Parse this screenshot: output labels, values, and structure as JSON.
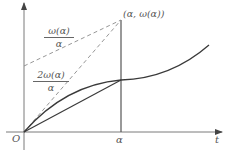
{
  "diagram": {
    "axes": {
      "origin_label": "O",
      "x_label": "t",
      "x_tick_label": "α"
    },
    "point_label": "(α, ω(α))",
    "slope_labels": {
      "upper": {
        "numerator": "ω(α)",
        "denominator": "α"
      },
      "lower": {
        "numerator": "2ω(α)",
        "denominator": "α"
      }
    },
    "colors": {
      "axis": "#7a7a7a",
      "curve": "#3a3a3a",
      "dashed": "#8a8a8a",
      "text": "#555555"
    }
  }
}
